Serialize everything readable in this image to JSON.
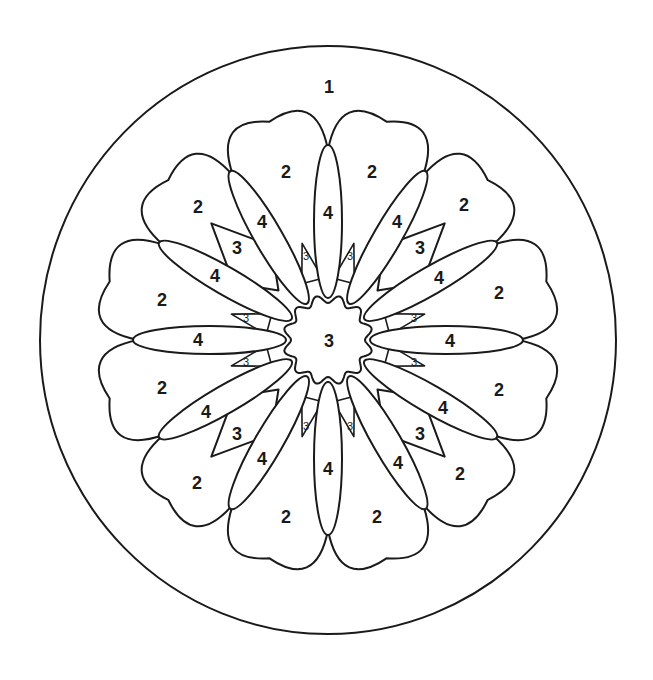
{
  "colors": {
    "line": "#1a1a1a",
    "background": "#ffffff"
  },
  "outer_circle": {
    "cx": 328,
    "cy": 340,
    "rx": 288,
    "ry": 294
  },
  "center": {
    "cx": 328,
    "cy": 340
  },
  "regions": {
    "outer": [
      {
        "label": "1",
        "x": 329,
        "y": 87
      }
    ],
    "scallops": [
      {
        "label": "2",
        "x": 286,
        "y": 172
      },
      {
        "label": "2",
        "x": 372,
        "y": 172
      },
      {
        "label": "2",
        "x": 198,
        "y": 207
      },
      {
        "label": "2",
        "x": 464,
        "y": 205
      },
      {
        "label": "2",
        "x": 162,
        "y": 300
      },
      {
        "label": "2",
        "x": 499,
        "y": 293
      },
      {
        "label": "2",
        "x": 162,
        "y": 388
      },
      {
        "label": "2",
        "x": 499,
        "y": 390
      },
      {
        "label": "2",
        "x": 197,
        "y": 483
      },
      {
        "label": "2",
        "x": 460,
        "y": 474
      },
      {
        "label": "2",
        "x": 286,
        "y": 517
      },
      {
        "label": "2",
        "x": 377,
        "y": 517
      }
    ],
    "petals": [
      {
        "label": "4",
        "x": 328,
        "y": 213
      },
      {
        "label": "4",
        "x": 262,
        "y": 222
      },
      {
        "label": "4",
        "x": 397,
        "y": 222
      },
      {
        "label": "4",
        "x": 215,
        "y": 276
      },
      {
        "label": "4",
        "x": 439,
        "y": 278
      },
      {
        "label": "4",
        "x": 198,
        "y": 340
      },
      {
        "label": "4",
        "x": 450,
        "y": 341
      },
      {
        "label": "4",
        "x": 206,
        "y": 412
      },
      {
        "label": "4",
        "x": 443,
        "y": 408
      },
      {
        "label": "4",
        "x": 262,
        "y": 459
      },
      {
        "label": "4",
        "x": 398,
        "y": 463
      },
      {
        "label": "4",
        "x": 328,
        "y": 469
      }
    ],
    "kites": [
      {
        "label": "3",
        "x": 237,
        "y": 248
      },
      {
        "label": "3",
        "x": 420,
        "y": 248
      },
      {
        "label": "3",
        "x": 237,
        "y": 434
      },
      {
        "label": "3",
        "x": 420,
        "y": 434
      }
    ],
    "core": [
      {
        "label": "3",
        "x": 329,
        "y": 341
      }
    ],
    "small_wedges": [
      {
        "label": "3",
        "x": 306,
        "y": 256
      },
      {
        "label": "3",
        "x": 350,
        "y": 256
      },
      {
        "label": "3",
        "x": 246,
        "y": 318
      },
      {
        "label": "3",
        "x": 414,
        "y": 318
      },
      {
        "label": "3",
        "x": 246,
        "y": 362
      },
      {
        "label": "3",
        "x": 414,
        "y": 362
      },
      {
        "label": "3",
        "x": 306,
        "y": 426
      },
      {
        "label": "3",
        "x": 350,
        "y": 426
      }
    ]
  }
}
